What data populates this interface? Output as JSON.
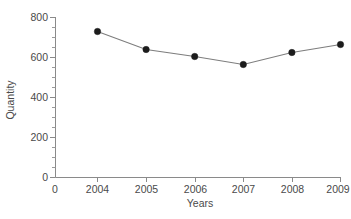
{
  "chart_data": {
    "type": "line",
    "title": "",
    "xlabel": "Years",
    "ylabel": "Quantity",
    "categories": [
      "2004",
      "2005",
      "2006",
      "2007",
      "2008",
      "2009"
    ],
    "values": [
      730,
      640,
      605,
      565,
      625,
      665
    ],
    "series": [
      {
        "name": "Quantity",
        "values": [
          730,
          640,
          605,
          565,
          625,
          665
        ]
      }
    ],
    "ylim": [
      0,
      800
    ],
    "y_ticks": [
      0,
      200,
      400,
      600,
      800
    ],
    "y_tick_labels": [
      "0",
      "200",
      "400",
      "600",
      "800"
    ],
    "y_minor_step": 100,
    "x_tick_labels": [
      "0",
      "2004",
      "2005",
      "2006",
      "2007",
      "2008",
      "2009"
    ],
    "x_origin_label": "0",
    "grid": false,
    "legend": false,
    "legend_position": "none",
    "marker": "filled-circle",
    "marker_color": "#1c1c1c",
    "line_color": "#7d7d7d",
    "axis_color": "#8a8a8a",
    "text_color": "#4a4a4a",
    "background_color": "#ffffff"
  }
}
